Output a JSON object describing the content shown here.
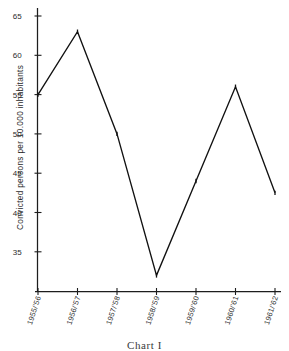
{
  "caption": "Chart I",
  "chart_data": {
    "type": "line",
    "title": "",
    "subtitle": "",
    "xlabel": "",
    "ylabel": "Convicted persons per 10.000 inhabitants",
    "categories": [
      "1955/'56",
      "1956/'57",
      "1957/'58",
      "1958/'59",
      "1959/'60",
      "1960/'61",
      "1961/'62"
    ],
    "values": [
      55,
      63,
      50,
      32,
      44,
      56,
      42.5
    ],
    "series": [
      {
        "name": "Convicted persons per 10.000 inhabitants",
        "values": [
          55,
          63,
          50,
          32,
          44,
          56,
          42.5
        ]
      }
    ],
    "yticks": [
      35,
      40,
      45,
      50,
      55,
      60,
      65
    ],
    "ytick_labels": [
      "35",
      "40",
      "45",
      "50",
      "55",
      "60",
      "65"
    ],
    "ylim": [
      31,
      66
    ],
    "xlim": [
      0,
      6
    ],
    "grid": false,
    "legend": false,
    "legend_position": "none",
    "line_color": "#111111",
    "axis_color": "#1d1d1d",
    "background": "#ffffff"
  }
}
